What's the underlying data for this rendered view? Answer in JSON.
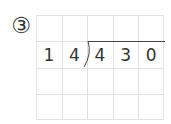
{
  "problem": {
    "marker": "③",
    "divisor": [
      "1",
      "4"
    ],
    "dividend": [
      "4",
      "3",
      "0"
    ]
  },
  "grid": {
    "columns": 5,
    "rows": 4
  },
  "colors": {
    "grid_line": "#e2e2e2",
    "text": "#333333"
  }
}
